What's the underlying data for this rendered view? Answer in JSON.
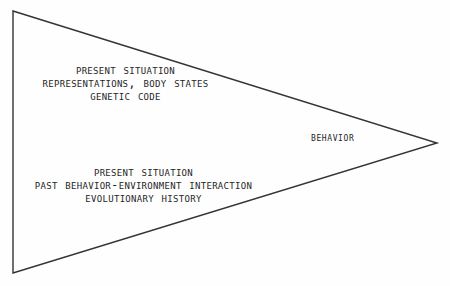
{
  "diagram": {
    "shape": {
      "name": "triangle",
      "points": "13,11 437,143 13,273",
      "stroke_color": "#333333",
      "fill_color": "none",
      "stroke_width": 1.4
    },
    "top_block": {
      "lines": [
        "Present Situation",
        "Representations, Body States",
        "Genetic Code"
      ]
    },
    "bottom_block": {
      "lines": [
        "Present Situation",
        "Past Behavior-Environment Interaction",
        "Evolutionary History"
      ]
    },
    "apex_label": "Behavior",
    "colors": {
      "background": "#fefefe",
      "text": "#262626",
      "line": "#333333"
    }
  }
}
